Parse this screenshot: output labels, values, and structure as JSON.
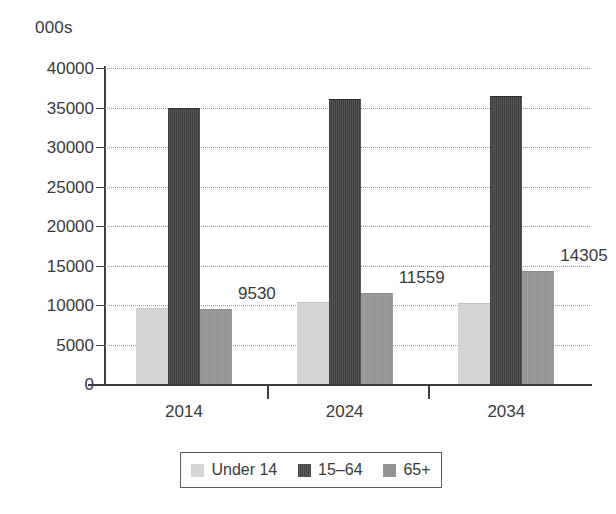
{
  "axis": {
    "unit_caption": "000s",
    "y_ticks": [
      "40000",
      "35000",
      "30000",
      "25000",
      "20000",
      "15000",
      "10000",
      "5000",
      "0"
    ],
    "x_categories": [
      "2014",
      "2024",
      "2034"
    ]
  },
  "legend": {
    "items": [
      {
        "label": "Under 14",
        "color": "#d5d5d5",
        "swatch": "legend-swatch-under-14"
      },
      {
        "label": "15–64",
        "color": "#3f3f3f",
        "swatch": "legend-swatch-15-64"
      },
      {
        "label": "65+",
        "color": "#949494",
        "swatch": "legend-swatch-65-plus"
      }
    ]
  },
  "chart_data": {
    "type": "bar",
    "title": "",
    "subtitle": "",
    "xlabel": "",
    "ylabel": "000s",
    "ylim": [
      0,
      40000
    ],
    "ytick_step": 5000,
    "grid": true,
    "legend_position": "bottom",
    "categories": [
      "2014",
      "2024",
      "2034"
    ],
    "series": [
      {
        "name": "Under 14",
        "color": "#d5d5d5",
        "values": [
          9600,
          10350,
          10300
        ],
        "labels": [
          "",
          "",
          ""
        ]
      },
      {
        "name": "15–64",
        "color": "#3f3f3f",
        "values": [
          35000,
          36100,
          36500
        ],
        "labels": [
          "",
          "",
          ""
        ]
      },
      {
        "name": "65+",
        "color": "#949494",
        "values": [
          9530,
          11559,
          14305
        ],
        "labels": [
          "9530",
          "11559",
          "14305"
        ]
      }
    ],
    "annotations": [
      "9530",
      "11559",
      "14305"
    ]
  }
}
